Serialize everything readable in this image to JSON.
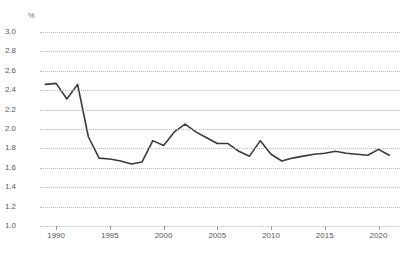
{
  "chart_data": {
    "type": "line",
    "title": "",
    "subtitle": "",
    "xlabel": "",
    "ylabel": "%",
    "y_unit_label": "%",
    "xlim": [
      1988.5,
      2022.0
    ],
    "ylim": [
      1.0,
      3.0
    ],
    "grid": true,
    "grid_style": "dotted-horizontal",
    "legend": "none",
    "line_color": "#3a3a3a",
    "grid_color": "#b9b9b9",
    "tick_label_color": "#58585a",
    "background_color": "#ffffff",
    "ytick_labels": [
      "3.0",
      "2.8",
      "2.6",
      "2.4",
      "2.2",
      "2.0",
      "1.8",
      "1.6",
      "1.4",
      "1.2",
      "1.0"
    ],
    "ytick_values": [
      3.0,
      2.8,
      2.6,
      2.4,
      2.2,
      2.0,
      1.8,
      1.6,
      1.4,
      1.2,
      1.0
    ],
    "xtick_labels": [
      "1990",
      "1995",
      "2000",
      "2005",
      "2010",
      "2015",
      "2020"
    ],
    "xtick_values": [
      1990,
      1995,
      2000,
      2005,
      2010,
      2015,
      2020
    ],
    "x": [
      1989,
      1990,
      1991,
      1992,
      1993,
      1994,
      1995,
      1996,
      1997,
      1998,
      1999,
      2000,
      2001,
      2002,
      2003,
      2004,
      2005,
      2006,
      2007,
      2008,
      2009,
      2010,
      2011,
      2012,
      2013,
      2014,
      2015,
      2016,
      2017,
      2018,
      2019,
      2020,
      2021
    ],
    "series": [
      {
        "name": "share",
        "values": [
          2.46,
          2.47,
          2.31,
          2.46,
          1.92,
          1.7,
          1.69,
          1.67,
          1.64,
          1.66,
          1.88,
          1.83,
          1.97,
          2.05,
          1.97,
          1.91,
          1.85,
          1.85,
          1.77,
          1.72,
          1.88,
          1.74,
          1.67,
          1.7,
          1.72,
          1.74,
          1.75,
          1.77,
          1.75,
          1.74,
          1.73,
          1.79,
          1.73
        ]
      }
    ]
  }
}
